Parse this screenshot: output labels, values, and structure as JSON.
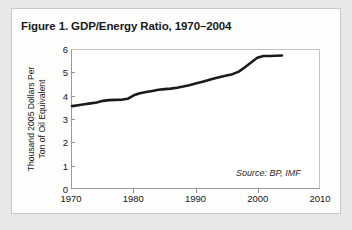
{
  "figure": {
    "title": "Figure 1. GDP/Energy Ratio, 1970–2004",
    "source_note": "Source: BP, IMF"
  },
  "chart_data": {
    "type": "line",
    "title": "Figure 1. GDP/Energy Ratio, 1970–2004",
    "xlabel": "",
    "ylabel": "Thousand 2005 Dollars Per Ton of Oil Equivalent",
    "ylabel_line1": "Thousand 2005 Dollars Per",
    "ylabel_line2": "Ton of Oil Equivalent",
    "annotation": "Source: BP, IMF",
    "grid": false,
    "legend": "none",
    "xlim": [
      1970,
      2010
    ],
    "ylim": [
      0,
      6
    ],
    "xticks": [
      1970,
      1980,
      1990,
      2000,
      2010
    ],
    "xtick_labels": [
      "1970",
      "1980",
      "1990",
      "2000",
      "2010"
    ],
    "yticks": [
      0,
      1,
      2,
      3,
      4,
      5,
      6
    ],
    "ytick_labels": [
      "0",
      "1",
      "2",
      "3",
      "4",
      "5",
      "6"
    ],
    "line_color": "#1a1a1a",
    "line_width": 2.6,
    "x": [
      1970,
      1971,
      1972,
      1973,
      1974,
      1975,
      1976,
      1977,
      1978,
      1979,
      1980,
      1981,
      1982,
      1983,
      1984,
      1985,
      1986,
      1987,
      1988,
      1989,
      1990,
      1991,
      1992,
      1993,
      1994,
      1995,
      1996,
      1997,
      1998,
      1999,
      2000,
      2001,
      2002,
      2003,
      2004
    ],
    "values": [
      3.56,
      3.6,
      3.64,
      3.68,
      3.72,
      3.79,
      3.82,
      3.83,
      3.84,
      3.88,
      4.03,
      4.12,
      4.17,
      4.22,
      4.27,
      4.3,
      4.32,
      4.36,
      4.41,
      4.47,
      4.54,
      4.61,
      4.68,
      4.76,
      4.83,
      4.89,
      4.95,
      5.06,
      5.25,
      5.46,
      5.66,
      5.74,
      5.74,
      5.75,
      5.76
    ]
  }
}
